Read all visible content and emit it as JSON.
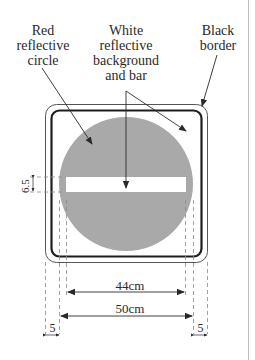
{
  "labels": {
    "red_circle": [
      "Red",
      "reflective",
      "circle"
    ],
    "white_background": [
      "White",
      "reflective",
      "background",
      "and bar"
    ],
    "black_border": [
      "Black",
      "border"
    ]
  },
  "dimensions": {
    "inner_width": "44cm",
    "outer_width": "50cm",
    "left_margin": "5",
    "right_margin": "5",
    "bar_height": "6.5"
  },
  "colors": {
    "circle_fill": "#a9a9a9",
    "bar_fill": "#ffffff",
    "border_stroke": "#1e1e1e",
    "outline_stroke": "#555555",
    "text": "#2a2a2a"
  }
}
